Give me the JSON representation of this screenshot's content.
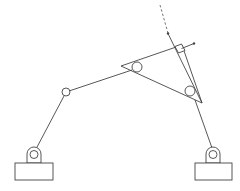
{
  "diagram": {
    "type": "mechanism-linkage",
    "stroke_color": "#444444",
    "background": "#ffffff",
    "components": [
      {
        "name": "left-ground-support",
        "kind": "fixed pivot"
      },
      {
        "name": "right-ground-support",
        "kind": "fixed pivot"
      },
      {
        "name": "left-crank",
        "kind": "link"
      },
      {
        "name": "middle-joint",
        "kind": "pin joint"
      },
      {
        "name": "coupler-link",
        "kind": "link"
      },
      {
        "name": "triangular-plate",
        "kind": "ternary link"
      },
      {
        "name": "right-rocker",
        "kind": "link"
      },
      {
        "name": "right-angle-marker",
        "kind": "annotation"
      },
      {
        "name": "dashed-extension-line",
        "kind": "annotation"
      }
    ]
  }
}
